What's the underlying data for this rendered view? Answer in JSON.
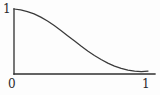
{
  "figure": {
    "kind": "line-plot",
    "background_color": "#fdfdfd",
    "ink_color": "#2f2f2f"
  },
  "axes": {
    "y_top_label": "1",
    "origin_label": "0",
    "x_right_label": "1",
    "axis_color": "#2f2f2f",
    "curve_color": "#3a3a3a"
  },
  "chart_data": {
    "type": "line",
    "title": "",
    "xlabel": "",
    "ylabel": "",
    "xlim": [
      0,
      1
    ],
    "ylim": [
      0,
      1
    ],
    "grid": false,
    "legend": false,
    "xticks": [
      0,
      1
    ],
    "xticklabels": [
      "0",
      "1"
    ],
    "yticks": [
      1
    ],
    "yticklabels": [
      "1"
    ],
    "series": [
      {
        "name": "decay",
        "x": [
          0.0,
          0.05,
          0.1,
          0.15,
          0.2,
          0.25,
          0.3,
          0.35,
          0.4,
          0.45,
          0.5,
          0.55,
          0.6,
          0.65,
          0.7,
          0.75,
          0.8,
          0.85,
          0.9,
          0.95,
          1.0
        ],
        "y": [
          1.0,
          0.985,
          0.96,
          0.925,
          0.875,
          0.815,
          0.745,
          0.67,
          0.59,
          0.51,
          0.43,
          0.355,
          0.285,
          0.222,
          0.168,
          0.122,
          0.086,
          0.06,
          0.044,
          0.038,
          0.045
        ]
      }
    ],
    "annotations": []
  },
  "geometry": {
    "x_axis_y": 74,
    "y_axis_x": 14,
    "x_axis_end": 155,
    "y_axis_top": 9
  }
}
